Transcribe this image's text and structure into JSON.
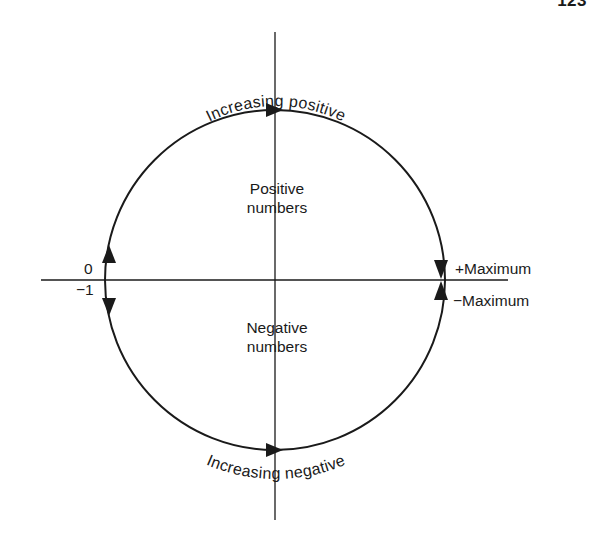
{
  "page": {
    "number": "123"
  },
  "diagram": {
    "arc_labels": {
      "top": "Increasing positive",
      "bottom": "Increasing negative"
    },
    "region_labels": {
      "upper_line1": "Positive",
      "upper_line2": "numbers",
      "lower_line1": "Negative",
      "lower_line2": "numbers"
    },
    "axis_labels": {
      "left_upper": "0",
      "left_lower": "−1",
      "right_upper": "+Maximum",
      "right_lower": "−Maximum"
    },
    "arrows": [
      {
        "position": "top",
        "direction": "right"
      },
      {
        "position": "bottom",
        "direction": "right"
      },
      {
        "position": "left-upper",
        "direction": "up"
      },
      {
        "position": "left-lower",
        "direction": "down"
      },
      {
        "position": "right-upper",
        "direction": "down"
      },
      {
        "position": "right-lower",
        "direction": "up"
      }
    ],
    "colors": {
      "ink": "#1a1a1a",
      "background": "#ffffff"
    }
  }
}
